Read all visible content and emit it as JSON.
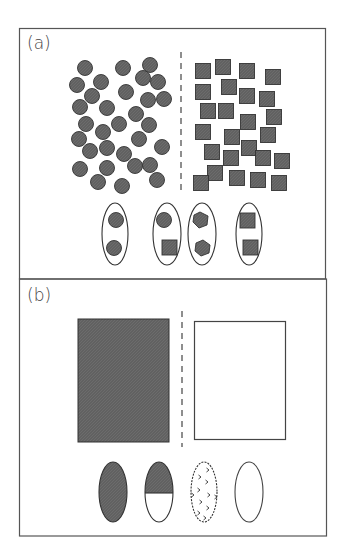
{
  "figure": {
    "panels": [
      {
        "id": "a",
        "label": "(a)",
        "left_group": "circles",
        "right_group": "squares",
        "circles": [
          [
            85,
            68
          ],
          [
            123,
            68
          ],
          [
            150,
            65
          ],
          [
            77,
            85
          ],
          [
            101,
            82
          ],
          [
            143,
            78
          ],
          [
            158,
            82
          ],
          [
            92,
            96
          ],
          [
            126,
            92
          ],
          [
            148,
            100
          ],
          [
            164,
            99
          ],
          [
            80,
            107
          ],
          [
            107,
            108
          ],
          [
            136,
            114
          ],
          [
            86,
            124
          ],
          [
            119,
            124
          ],
          [
            149,
            125
          ],
          [
            103,
            132
          ],
          [
            79,
            139
          ],
          [
            139,
            139
          ],
          [
            162,
            147
          ],
          [
            90,
            151
          ],
          [
            107,
            148
          ],
          [
            124,
            154
          ],
          [
            135,
            166
          ],
          [
            150,
            165
          ],
          [
            80,
            169
          ],
          [
            107,
            168
          ],
          [
            98,
            182
          ],
          [
            122,
            186
          ],
          [
            157,
            180
          ]
        ],
        "squares": [
          [
            203,
            71
          ],
          [
            223,
            67
          ],
          [
            247,
            71
          ],
          [
            273,
            77
          ],
          [
            203,
            92
          ],
          [
            229,
            87
          ],
          [
            247,
            96
          ],
          [
            267,
            99
          ],
          [
            208,
            111
          ],
          [
            226,
            111
          ],
          [
            248,
            122
          ],
          [
            274,
            117
          ],
          [
            203,
            132
          ],
          [
            232,
            137
          ],
          [
            268,
            135
          ],
          [
            212,
            152
          ],
          [
            249,
            148
          ],
          [
            231,
            158
          ],
          [
            263,
            158
          ],
          [
            282,
            161
          ],
          [
            215,
            173
          ],
          [
            201,
            183
          ],
          [
            237,
            178
          ],
          [
            258,
            180
          ],
          [
            279,
            183
          ]
        ],
        "pairs": [
          {
            "name": "circle-circle",
            "shapes": [
              "circle",
              "circle"
            ]
          },
          {
            "name": "circle-square",
            "shapes": [
              "circle",
              "square"
            ]
          },
          {
            "name": "hexagon-hexagon",
            "shapes": [
              "hexagon",
              "hexagon"
            ]
          },
          {
            "name": "square-square",
            "shapes": [
              "square",
              "square"
            ]
          }
        ]
      },
      {
        "id": "b",
        "label": "(b)",
        "left_block": "filled",
        "right_block": "empty",
        "ovals": [
          {
            "name": "fully-filled"
          },
          {
            "name": "half-filled"
          },
          {
            "name": "dotted"
          },
          {
            "name": "empty"
          }
        ]
      }
    ],
    "colors": {
      "fill": "#5f5f5f",
      "stroke": "#3a3a3a",
      "frame": "#555555",
      "background": "#ffffff"
    }
  }
}
